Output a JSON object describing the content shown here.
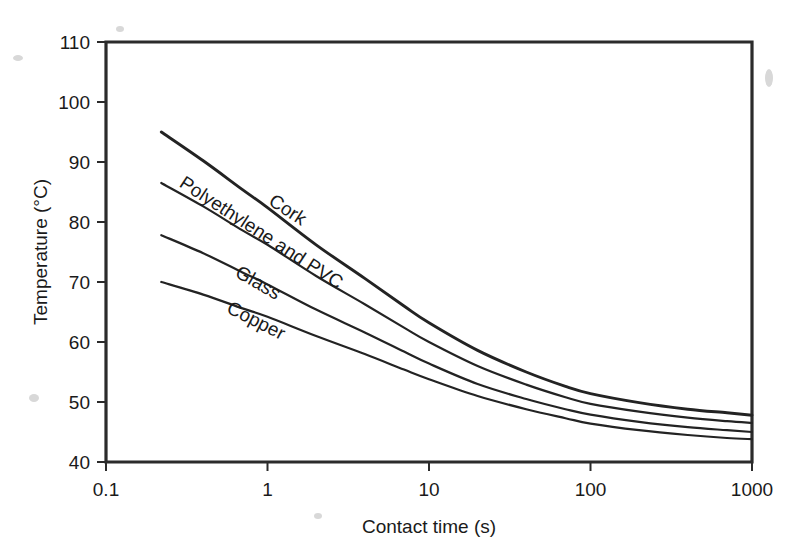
{
  "chart_data": {
    "type": "line",
    "title": "",
    "xlabel": "Contact time (s)",
    "ylabel": "Temperature (°C)",
    "xscale": "log",
    "yscale": "linear",
    "xlim": [
      0.1,
      1000
    ],
    "ylim": [
      40,
      110
    ],
    "xticks": [
      "0.1",
      "1",
      "10",
      "100",
      "1000"
    ],
    "xtick_values": [
      0.1,
      1,
      10,
      100,
      1000
    ],
    "yticks": [
      "40",
      "50",
      "60",
      "70",
      "80",
      "90",
      "100",
      "110"
    ],
    "ytick_values": [
      40,
      50,
      60,
      70,
      80,
      90,
      100,
      110
    ],
    "grid": false,
    "legend_position": "inline-labels",
    "series": [
      {
        "name": "Cork",
        "label": "Cork",
        "x": [
          0.22,
          0.4,
          0.7,
          1,
          2,
          4,
          7,
          10,
          20,
          40,
          70,
          100,
          200,
          400,
          700,
          1000
        ],
        "y": [
          95.0,
          90.2,
          85.4,
          82.4,
          76.2,
          70.6,
          66.0,
          63.2,
          58.6,
          55.0,
          52.6,
          51.4,
          49.9,
          48.8,
          48.2,
          47.8
        ]
      },
      {
        "name": "Polyethylene and PVC",
        "label": "Polyethylene and PVC",
        "x": [
          0.22,
          0.4,
          0.7,
          1,
          2,
          4,
          7,
          10,
          20,
          40,
          70,
          100,
          200,
          400,
          700,
          1000
        ],
        "y": [
          86.5,
          82.6,
          78.6,
          76.2,
          71.0,
          66.3,
          62.4,
          60.0,
          56.0,
          52.9,
          50.8,
          49.7,
          48.4,
          47.4,
          46.8,
          46.5
        ]
      },
      {
        "name": "Glass",
        "label": "Glass",
        "x": [
          0.22,
          0.4,
          0.7,
          1,
          2,
          4,
          7,
          10,
          20,
          40,
          70,
          100,
          200,
          400,
          700,
          1000
        ],
        "y": [
          77.8,
          74.8,
          71.6,
          69.6,
          65.4,
          61.6,
          58.4,
          56.4,
          53.0,
          50.5,
          48.8,
          47.9,
          46.7,
          45.8,
          45.3,
          45.0
        ]
      },
      {
        "name": "Copper",
        "label": "Copper",
        "x": [
          0.22,
          0.4,
          0.7,
          1,
          2,
          4,
          7,
          10,
          20,
          40,
          70,
          100,
          200,
          400,
          700,
          1000
        ],
        "y": [
          70.0,
          67.9,
          65.6,
          64.2,
          61.0,
          58.0,
          55.4,
          53.8,
          51.0,
          48.8,
          47.3,
          46.4,
          45.3,
          44.5,
          44.0,
          43.8
        ]
      }
    ],
    "annotations": [
      {
        "text": "Cork",
        "x": 1.0,
        "y": 83,
        "rotation": 33
      },
      {
        "text": "Polyethylene and PVC",
        "x": 0.28,
        "y": 86,
        "rotation": 33
      },
      {
        "text": "Glass",
        "x": 0.62,
        "y": 71,
        "rotation": 30
      },
      {
        "text": "Copper",
        "x": 0.55,
        "y": 65,
        "rotation": 27
      }
    ],
    "colors": {
      "curve": "#232323",
      "axis": "#2b2b2b",
      "background": "#ffffff",
      "text": "#1a1a1a"
    }
  }
}
